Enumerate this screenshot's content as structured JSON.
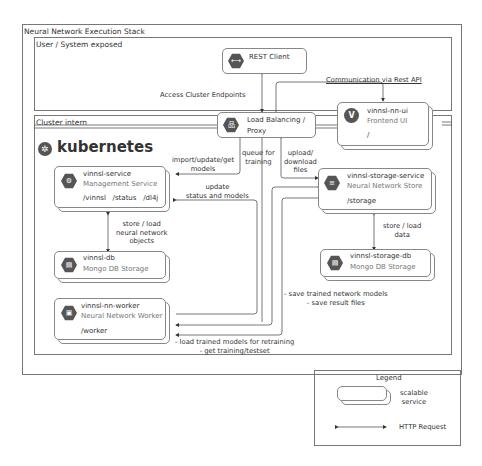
{
  "outer_frame": {
    "title": "Neural Network Execution Stack"
  },
  "user_frame": {
    "title": "User / System exposed"
  },
  "cluster_frame": {
    "title": "Cluster intern",
    "brand": "kubernetes"
  },
  "services": {
    "rest_client": {
      "name": "REST Client",
      "icon": "api-icon"
    },
    "load_balancer": {
      "name": "Load Balancing /",
      "name2": "Proxy",
      "icon": "network-icon"
    },
    "frontend": {
      "name": "vinnsl-nn-ui",
      "desc": "Frontend UI",
      "path": "/",
      "icon": "vue-icon"
    },
    "mgmt": {
      "name": "vinnsl-service",
      "desc": "Management Service",
      "path": "/vinnsl   /status   /dl4j",
      "icon": "gear-icon"
    },
    "db": {
      "name": "vinnsl-db",
      "desc": "Mongo DB Storage",
      "icon": "database-icon"
    },
    "worker": {
      "name": "vinnsl-nn-worker",
      "desc": "Neural Network Worker",
      "path": "/worker",
      "icon": "cpu-icon"
    },
    "storage": {
      "name": "vinnsl-storage-service",
      "desc": "Neural Network Store",
      "path": "/storage",
      "icon": "storage-icon"
    },
    "storage_db": {
      "name": "vinnsl-storage-db",
      "desc": "Mongo DB Storage",
      "icon": "database-icon"
    }
  },
  "labels": {
    "access": "Access Cluster Endpoints",
    "comm": "Communication via Rest API",
    "import1": "import/update/get",
    "import2": "models",
    "queue1": "queue for",
    "queue2": "training",
    "upload1": "upload/",
    "upload2": "download",
    "upload3": "files",
    "update1": "update",
    "update2": "status and models",
    "storeload1": "store / load",
    "storeload2": "neural network",
    "storeload3": "objects",
    "storedata1": "store / load",
    "storedata2": "data",
    "save1": "- save trained network models",
    "save2": "- save result files",
    "loadtrained1": "- load trained models for retraining",
    "loadtrained2": "- get training/testset"
  },
  "legend": {
    "title": "Legend",
    "scalable1": "scalable",
    "scalable2": "service",
    "http": "HTTP Request"
  }
}
